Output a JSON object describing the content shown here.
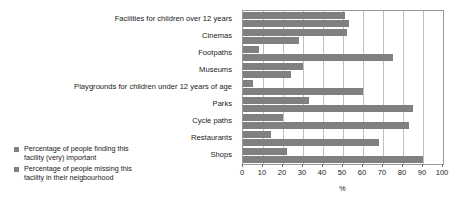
{
  "chart_data": {
    "type": "bar",
    "orientation": "horizontal",
    "title": "",
    "xlabel": "%",
    "ylabel": "",
    "xlim": [
      0,
      100
    ],
    "xticks": [
      0,
      10,
      20,
      30,
      40,
      50,
      60,
      70,
      80,
      90,
      100
    ],
    "grid": true,
    "legend_position": "bottom-left",
    "categories": [
      "Facilities for children over 12 years",
      "Cinemas",
      "Footpaths",
      "Museums",
      "Playgrounds for children under 12 years of age",
      "Parks",
      "Cycle paths",
      "Restaurants",
      "Shops"
    ],
    "series": [
      {
        "name": "Percentage of people missing this facility in their neigbourhood",
        "color": "#808080",
        "values": [
          51,
          52,
          8,
          30,
          5,
          33,
          20,
          14,
          22
        ]
      },
      {
        "name": "Percentage of people finding this facility (very) important",
        "color": "#808080",
        "values": [
          53,
          28,
          75,
          24,
          60,
          85,
          83,
          68,
          90
        ]
      }
    ]
  },
  "axis": {
    "x_title": "%",
    "tick_labels": [
      "0",
      "10",
      "20",
      "30",
      "40",
      "50",
      "60",
      "70",
      "80",
      "90",
      "100"
    ]
  },
  "legend": {
    "entries": [
      {
        "line1": "Percentage of people finding this",
        "line2": "facility (very) important"
      },
      {
        "line1": "Percentage of people missing this",
        "line2": "facility in their neigbourhood"
      }
    ]
  }
}
